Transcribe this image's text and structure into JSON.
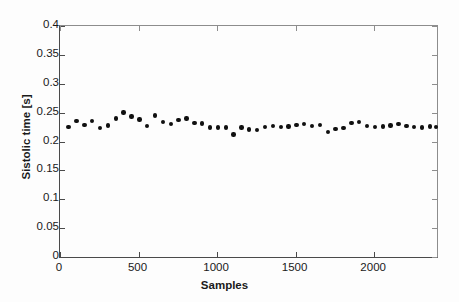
{
  "chart_data": {
    "type": "scatter",
    "title": "",
    "xlabel": "Samples",
    "ylabel": "Sistolic time [s]",
    "xlim": [
      0,
      2400
    ],
    "ylim": [
      0,
      0.4
    ],
    "xticks": [
      0,
      500,
      1000,
      1500,
      2000
    ],
    "yticks": [
      0,
      0.05,
      0.1,
      0.15,
      0.2,
      0.25,
      0.3,
      0.35,
      0.4
    ],
    "xticklabels": [
      "0",
      "500",
      "1000",
      "1500",
      "2000"
    ],
    "yticklabels": [
      "0",
      "0.05",
      "0.1",
      "0.15",
      "0.2",
      "0.25",
      "0.3",
      "0.35",
      "0.4"
    ],
    "grid": false,
    "legend": null,
    "marker": "filled-circle",
    "marker_color": "#101010",
    "x": [
      55,
      105,
      155,
      205,
      255,
      305,
      355,
      405,
      455,
      505,
      555,
      605,
      655,
      705,
      755,
      805,
      855,
      905,
      955,
      1005,
      1055,
      1105,
      1155,
      1205,
      1255,
      1305,
      1355,
      1405,
      1455,
      1505,
      1555,
      1605,
      1655,
      1705,
      1755,
      1805,
      1855,
      1905,
      1955,
      2005,
      2055,
      2105,
      2155,
      2205,
      2255,
      2305,
      2355,
      2395
    ],
    "y": [
      0.225,
      0.235,
      0.229,
      0.235,
      0.223,
      0.228,
      0.24,
      0.25,
      0.243,
      0.238,
      0.227,
      0.245,
      0.234,
      0.23,
      0.237,
      0.24,
      0.232,
      0.231,
      0.224,
      0.224,
      0.224,
      0.212,
      0.224,
      0.221,
      0.22,
      0.225,
      0.227,
      0.225,
      0.226,
      0.229,
      0.23,
      0.227,
      0.229,
      0.216,
      0.222,
      0.223,
      0.232,
      0.234,
      0.227,
      0.225,
      0.226,
      0.228,
      0.23,
      0.227,
      0.225,
      0.224,
      0.226,
      0.225
    ]
  }
}
